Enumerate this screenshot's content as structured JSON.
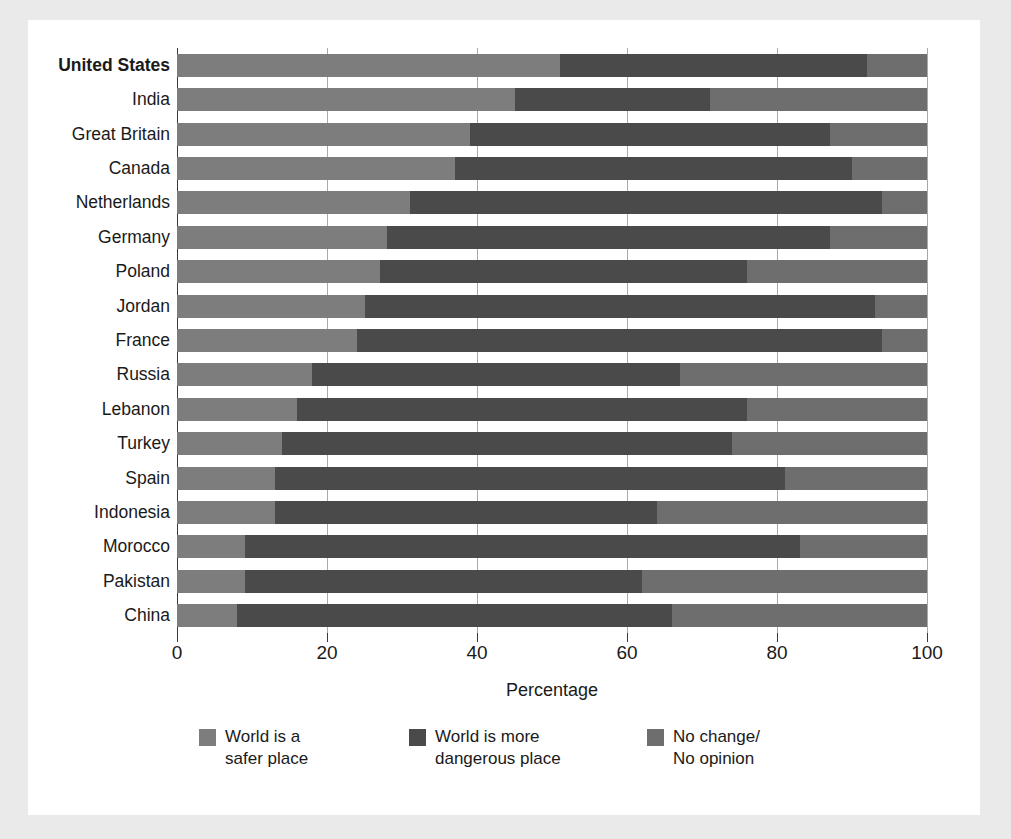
{
  "chart_data": {
    "type": "bar",
    "orientation": "horizontal",
    "stacked": true,
    "title": "",
    "xlabel": "Percentage",
    "ylabel": "",
    "xlim": [
      0,
      100
    ],
    "xticks": [
      0,
      20,
      40,
      60,
      80,
      100
    ],
    "grid": true,
    "legend_position": "bottom",
    "categories": [
      "United States",
      "India",
      "Great Britain",
      "Canada",
      "Netherlands",
      "Germany",
      "Poland",
      "Jordan",
      "France",
      "Russia",
      "Lebanon",
      "Turkey",
      "Spain",
      "Indonesia",
      "Morocco",
      "Pakistan",
      "China"
    ],
    "highlighted_category": "United States",
    "series": [
      {
        "name": "World is a safer place",
        "color": "#7d7d7d",
        "values": [
          51,
          45,
          39,
          37,
          31,
          28,
          27,
          25,
          24,
          18,
          16,
          14,
          13,
          13,
          9,
          9,
          8
        ]
      },
      {
        "name": "World is more dangerous place",
        "color": "#4a4a4a",
        "values": [
          41,
          26,
          48,
          53,
          63,
          59,
          49,
          68,
          70,
          49,
          60,
          60,
          68,
          51,
          74,
          53,
          58
        ]
      },
      {
        "name": "No change/ No opinion",
        "color": "#6e6e6e",
        "values": [
          8,
          29,
          13,
          10,
          6,
          13,
          24,
          7,
          6,
          33,
          24,
          26,
          19,
          36,
          17,
          38,
          34
        ]
      }
    ]
  },
  "axis": {
    "x_title": "Percentage",
    "tick_labels": [
      "0",
      "20",
      "40",
      "60",
      "80",
      "100"
    ]
  },
  "legend": {
    "items": [
      {
        "name": "safer",
        "line1": "World is a",
        "line2": "safer place"
      },
      {
        "name": "dangerous",
        "line1": "World is more",
        "line2": "dangerous place"
      },
      {
        "name": "nochange",
        "line1": "No change/",
        "line2": "No opinion"
      }
    ]
  },
  "colors": {
    "safer": "#7d7d7d",
    "dangerous": "#4a4a4a",
    "nochange": "#6e6e6e",
    "panel": "#ffffff",
    "page": "#eaeaea"
  }
}
